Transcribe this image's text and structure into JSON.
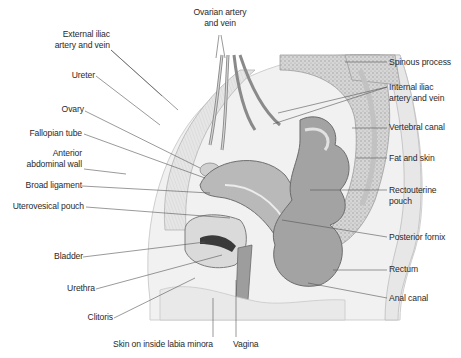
{
  "figure": {
    "colors": {
      "background": "#ffffff",
      "label_text": "#2a2a2a",
      "leader_line": "#555555",
      "tissue_light": "#ececec",
      "tissue_mid": "#c9c9c9",
      "tissue_dark": "#8f8f8f",
      "organ_fill": "#a7a7a7",
      "lumen_dark": "#3a3a3a"
    }
  },
  "labels": {
    "left": [
      {
        "id": "external-iliac",
        "lines": [
          "External iliac",
          "artery and vein"
        ]
      },
      {
        "id": "ureter",
        "lines": [
          "Ureter"
        ]
      },
      {
        "id": "ovary",
        "lines": [
          "Ovary"
        ]
      },
      {
        "id": "fallopian-tube",
        "lines": [
          "Fallopian tube"
        ]
      },
      {
        "id": "anterior-abdominal-wall",
        "lines": [
          "Anterior",
          "abdominal wall"
        ]
      },
      {
        "id": "broad-ligament",
        "lines": [
          "Broad ligament"
        ]
      },
      {
        "id": "uterovesical-pouch",
        "lines": [
          "Uterovesical pouch"
        ]
      },
      {
        "id": "bladder",
        "lines": [
          "Bladder"
        ]
      },
      {
        "id": "urethra",
        "lines": [
          "Urethra"
        ]
      },
      {
        "id": "clitoris",
        "lines": [
          "Clitoris"
        ]
      }
    ],
    "top": [
      {
        "id": "ovarian-artery",
        "lines": [
          "Ovarian artery",
          "and vein"
        ]
      }
    ],
    "right": [
      {
        "id": "spinous-process",
        "lines": [
          "Spinous process"
        ]
      },
      {
        "id": "internal-iliac",
        "lines": [
          "Internal iliac",
          "artery and vein"
        ]
      },
      {
        "id": "vertebral-canal",
        "lines": [
          "Vertebral canal"
        ]
      },
      {
        "id": "fat-and-skin",
        "lines": [
          "Fat and skin"
        ]
      },
      {
        "id": "rectouterine-pouch",
        "lines": [
          "Rectouterine",
          "pouch"
        ]
      },
      {
        "id": "posterior-fornix",
        "lines": [
          "Posterior fornix"
        ]
      },
      {
        "id": "rectum",
        "lines": [
          "Rectum"
        ]
      },
      {
        "id": "anal-canal",
        "lines": [
          "Anal canal"
        ]
      }
    ],
    "bottom": [
      {
        "id": "skin-labia-minora",
        "lines": [
          "Skin on inside labia minora"
        ]
      },
      {
        "id": "vagina",
        "lines": [
          "Vagina"
        ]
      }
    ]
  }
}
